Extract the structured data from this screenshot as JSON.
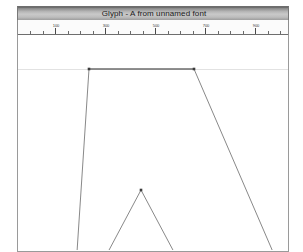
{
  "window": {
    "title": "Glyph - A from unnamed font",
    "glyph_name": "A",
    "font_name": "unnamed font"
  },
  "ruler": {
    "orientation": "horizontal",
    "unit": "font-units",
    "major_labels": [
      "100",
      "300",
      "500",
      "700",
      "900"
    ],
    "major_positions_px": [
      37,
      87,
      137,
      187,
      237
    ],
    "minor_spacing_px": 12.5,
    "tick_count": 22
  },
  "canvas": {
    "guides": [
      {
        "name": "cap-height",
        "orientation": "horizontal",
        "y_px": 34
      }
    ],
    "glyph_outline": {
      "glyph": "A",
      "contours": [
        {
          "name": "outer-contour",
          "points_px": [
            [
              71,
              34
            ],
            [
              176,
              34
            ],
            [
              255,
              217
            ],
            [
              59,
              217
            ]
          ]
        },
        {
          "name": "inner-counter",
          "points_px": [
            [
              123,
              155
            ],
            [
              156,
              217
            ],
            [
              90,
              217
            ]
          ]
        }
      ],
      "control_points_px": [
        [
          71,
          34
        ],
        [
          176,
          34
        ],
        [
          123,
          155
        ]
      ]
    }
  },
  "colors": {
    "titlebar_dark": "#5f5f5f",
    "titlebar_light": "#c9c9c9",
    "outline_stroke": "#7a7a7a",
    "outline_top_stroke": "#6b6b6b",
    "guide": "#e2e2e2",
    "canvas_bg": "#ffffff",
    "page_bg": "#ffffff"
  }
}
